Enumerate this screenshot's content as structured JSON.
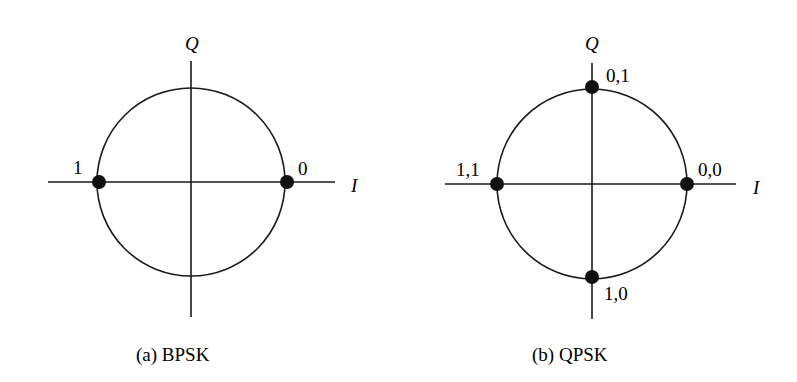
{
  "panels": [
    {
      "id": "bpsk",
      "caption": "(a)  BPSK",
      "axis_labels": {
        "vertical": "Q",
        "horizontal": "I"
      },
      "points": [
        {
          "label": "1",
          "position": "left"
        },
        {
          "label": "0",
          "position": "right"
        }
      ]
    },
    {
      "id": "qpsk",
      "caption": "(b)  QPSK",
      "axis_labels": {
        "vertical": "Q",
        "horizontal": "I"
      },
      "points": [
        {
          "label": "0,1",
          "position": "top"
        },
        {
          "label": "1,1",
          "position": "left"
        },
        {
          "label": "0,0",
          "position": "right"
        },
        {
          "label": "1,0",
          "position": "bottom"
        }
      ]
    }
  ],
  "colors": {
    "stroke": "#1a1a1a",
    "point": "#111111",
    "background": "#ffffff"
  }
}
